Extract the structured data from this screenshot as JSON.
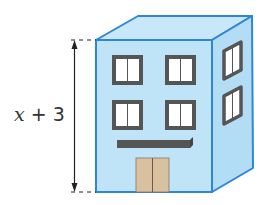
{
  "diagram": {
    "height_label": {
      "variable": "x",
      "rest": " + 3"
    },
    "front_windows": 4,
    "side_windows": 2,
    "colors": {
      "wall_front": "#bfe3f7",
      "wall_side": "#b3ddf5",
      "roof": "#c8e8f9",
      "edge": "#2f86d6",
      "window_frame": "#555555",
      "window_glass": "#ffffff",
      "awning": "#555555",
      "door": "#d9c1a0",
      "arrow": "#222222"
    }
  }
}
